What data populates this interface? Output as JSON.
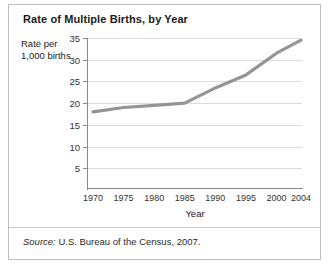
{
  "card": {
    "title": "Rate of Multiple Births, by Year",
    "source_lead": "Source:",
    "source_text": " U.S. Bureau of the Census, 2007.",
    "line_color": "#949494",
    "grid_color": "#dcdcdc",
    "axis_color": "#8a8a8a",
    "background": "#ffffff"
  },
  "chart_data": {
    "type": "line",
    "title": "Rate of Multiple Births, by Year",
    "xlabel": "Year",
    "ylabel": "Rate per 1,000 births",
    "ylabel_lines": [
      "Rate per",
      "1,000 births"
    ],
    "x": [
      1970,
      1975,
      1980,
      1985,
      1990,
      1995,
      2000,
      2004
    ],
    "xtick_labels": [
      "1970",
      "1975",
      "1980",
      "1985",
      "1990",
      "1995",
      "2000",
      "2004"
    ],
    "values": [
      18,
      19,
      19.5,
      20,
      23.5,
      26.5,
      31.5,
      34.5
    ],
    "series": [
      {
        "name": "Rate of multiple births",
        "values": [
          18,
          19,
          19.5,
          20,
          23.5,
          26.5,
          31.5,
          34.5
        ]
      }
    ],
    "yticks": [
      35,
      30,
      25,
      20,
      15,
      10,
      5
    ],
    "ytick_labels": [
      "35",
      "30",
      "25",
      "20",
      "15",
      "10",
      "5"
    ],
    "ylim": [
      0,
      35
    ],
    "xlim": [
      1970,
      2004
    ],
    "grid": "horizontal",
    "legend": "none",
    "annotations": []
  }
}
